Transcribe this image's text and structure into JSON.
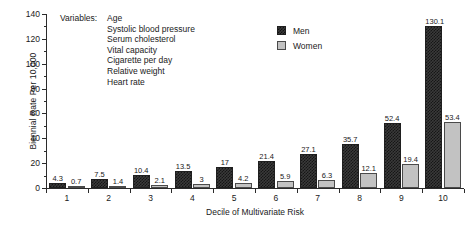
{
  "chart_data": {
    "type": "bar",
    "title": "",
    "xlabel": "Decile of Multivariate Risk",
    "ylabel": "Biennial Rate Per 10,000",
    "categories": [
      "1",
      "2",
      "3",
      "4",
      "5",
      "6",
      "7",
      "8",
      "9",
      "10"
    ],
    "series": [
      {
        "name": "Men",
        "values": [
          4.3,
          7.5,
          10.4,
          13.5,
          17,
          21.4,
          27.1,
          35.7,
          52.4,
          130.1
        ],
        "labels": [
          "4.3",
          "7.5",
          "10.4",
          "13.5",
          "17",
          "21.4",
          "27.1",
          "35.7",
          "52.4",
          "130.1"
        ],
        "color": "#3a3a3a",
        "pattern": "checkerboard"
      },
      {
        "name": "Women",
        "values": [
          0.7,
          1.4,
          2.1,
          3,
          4.2,
          5.9,
          6.3,
          12.1,
          19.4,
          53.4
        ],
        "labels": [
          "0.7",
          "1.4",
          "2.1",
          "3",
          "4.2",
          "5.9",
          "6.3",
          "12.1",
          "19.4",
          "53.4"
        ],
        "color": "#c2c2c2",
        "pattern": "solid-light-gray"
      }
    ],
    "ylim": [
      0,
      140
    ],
    "yticks": [
      0,
      20,
      40,
      60,
      80,
      100,
      120,
      140
    ],
    "ytick_labels": [
      "0",
      "20",
      "40",
      "60",
      "80",
      "100",
      "120",
      "140"
    ],
    "y_minor_ticks": [
      10,
      30,
      50,
      70,
      90,
      110,
      130
    ],
    "grid": false,
    "legend_position": "top-center-right"
  },
  "annotation": {
    "variables_title": "Variables:",
    "variables": [
      "Age",
      "Systolic blood pressure",
      "Serum cholesterol",
      "Vital capacity",
      "Cigarette per day",
      "Relative weight",
      "Heart rate"
    ]
  },
  "legend": {
    "entries": [
      {
        "label": "Men"
      },
      {
        "label": "Women"
      }
    ]
  }
}
